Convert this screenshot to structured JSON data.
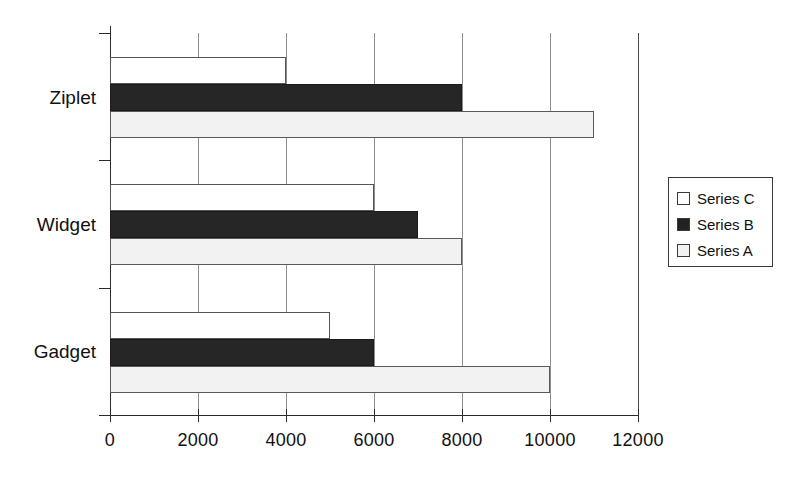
{
  "chart_data": {
    "type": "bar",
    "orientation": "horizontal",
    "title": "",
    "xlabel": "",
    "ylabel": "",
    "categories": [
      "Ziplet",
      "Widget",
      "Gadget"
    ],
    "series": [
      {
        "name": "Series A",
        "values": [
          11000,
          8000,
          10000
        ],
        "color": "#f2f2f2"
      },
      {
        "name": "Series B",
        "values": [
          8000,
          7000,
          6000
        ],
        "color": "#262626"
      },
      {
        "name": "Series C",
        "values": [
          4000,
          6000,
          5000
        ],
        "color": "#ffffff"
      }
    ],
    "legend_order": [
      "Series C",
      "Series B",
      "Series A"
    ],
    "legend_position": "right",
    "xlim": [
      0,
      12000
    ],
    "xticks": [
      0,
      2000,
      4000,
      6000,
      8000,
      10000,
      12000
    ],
    "xtick_labels": [
      "0",
      "2000",
      "4000",
      "6000",
      "8000",
      "10000",
      "12000"
    ],
    "grid": "vertical"
  },
  "legend": {
    "items": [
      {
        "label": "Series C",
        "swatch": "s-c"
      },
      {
        "label": "Series B",
        "swatch": "s-b"
      },
      {
        "label": "Series A",
        "swatch": "s-a"
      }
    ]
  },
  "axis": {
    "x_labels": [
      "0",
      "2000",
      "4000",
      "6000",
      "8000",
      "10000",
      "12000"
    ],
    "y_labels": [
      "Ziplet",
      "Widget",
      "Gadget"
    ]
  }
}
